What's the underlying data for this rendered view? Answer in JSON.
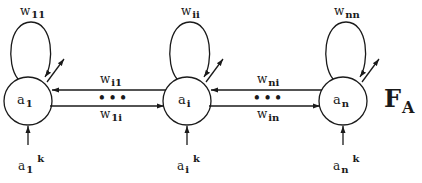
{
  "diagram": {
    "layer_label": {
      "main": "F",
      "sub": "A"
    },
    "nodes": [
      {
        "id": "a1",
        "label": "a",
        "sub": "1",
        "self_weight": {
          "main": "w",
          "sub": "11"
        },
        "input": {
          "main": "a",
          "sub": "1",
          "sup": "k"
        }
      },
      {
        "id": "ai",
        "label": "a",
        "sub": "i",
        "self_weight": {
          "main": "w",
          "sub": "ii"
        },
        "input": {
          "main": "a",
          "sub": "i",
          "sup": "k"
        }
      },
      {
        "id": "an",
        "label": "a",
        "sub": "n",
        "self_weight": {
          "main": "w",
          "sub": "nn"
        },
        "input": {
          "main": "a",
          "sub": "n",
          "sup": "k"
        }
      }
    ],
    "edges": [
      {
        "from": "ai",
        "to": "a1",
        "label": {
          "main": "w",
          "sub": "i1"
        }
      },
      {
        "from": "a1",
        "to": "ai",
        "label": {
          "main": "w",
          "sub": "1i"
        }
      },
      {
        "from": "an",
        "to": "ai",
        "label": {
          "main": "w",
          "sub": "ni"
        }
      },
      {
        "from": "ai",
        "to": "an",
        "label": {
          "main": "w",
          "sub": "in"
        }
      }
    ],
    "ellipsis": "•••",
    "colors": {
      "stroke": "#1a1a1a",
      "background": "#ffffff"
    }
  }
}
